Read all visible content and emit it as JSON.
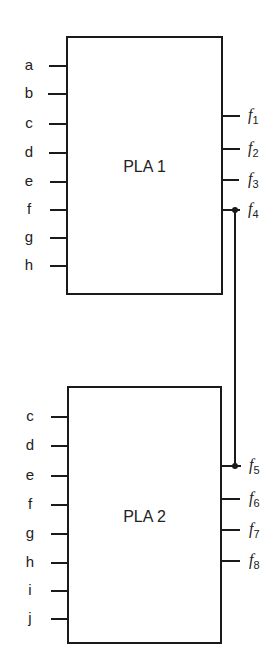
{
  "colors": {
    "line": "#1a1a1a",
    "background": "#ffffff"
  },
  "pla1": {
    "title": "PLA 1",
    "inputs": [
      "a",
      "b",
      "c",
      "d",
      "e",
      "f",
      "g",
      "h"
    ],
    "outputs": [
      {
        "base": "f",
        "sub": "1"
      },
      {
        "base": "f",
        "sub": "2"
      },
      {
        "base": "f",
        "sub": "3"
      },
      {
        "base": "f",
        "sub": "4"
      }
    ]
  },
  "pla2": {
    "title": "PLA 2",
    "inputs": [
      "c",
      "d",
      "e",
      "f",
      "g",
      "h",
      "i",
      "j"
    ],
    "outputs": [
      {
        "base": "f",
        "sub": "5"
      },
      {
        "base": "f",
        "sub": "6"
      },
      {
        "base": "f",
        "sub": "7"
      },
      {
        "base": "f",
        "sub": "8"
      }
    ]
  },
  "connection": {
    "from": "f4",
    "to": "f5"
  }
}
